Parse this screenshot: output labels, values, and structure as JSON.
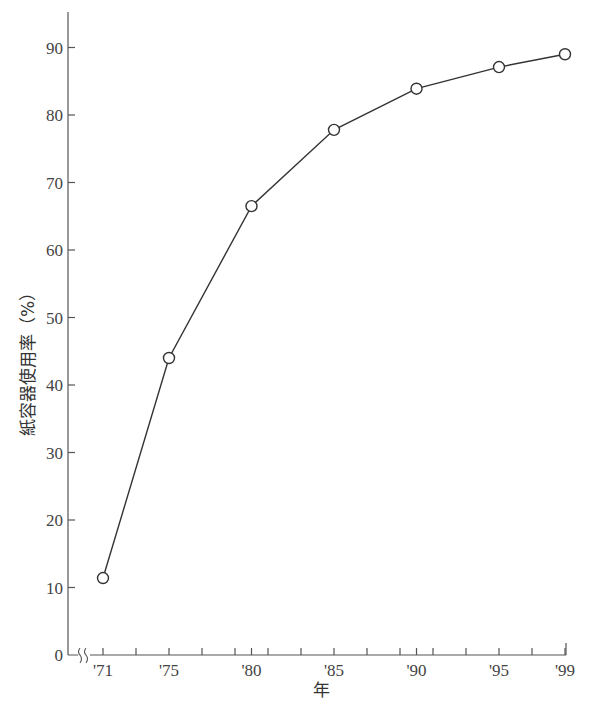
{
  "chart_data": {
    "type": "line",
    "title": "",
    "xlabel": "年",
    "ylabel": "紙容器使用率（%）",
    "x": [
      1971,
      1975,
      1980,
      1985,
      1990,
      1995,
      1999
    ],
    "categories": [
      "'71",
      "'75",
      "'80",
      "'85",
      "'90",
      "'95",
      "'99"
    ],
    "series": [
      {
        "name": "紙容器使用率",
        "values": [
          11.4,
          44.0,
          66.5,
          77.8,
          83.9,
          87.1,
          89.0
        ]
      }
    ],
    "ylim": [
      0,
      95
    ],
    "y_ticks": [
      0,
      10,
      20,
      30,
      40,
      50,
      60,
      70,
      80,
      90
    ],
    "x_tick_labels": [
      "'71",
      "'75",
      "'80",
      "'85",
      "'90",
      "'95",
      "'99"
    ],
    "x_minor_ticks": [
      1971,
      1973,
      1975,
      1977,
      1979,
      1980,
      1981,
      1983,
      1985,
      1987,
      1989,
      1990,
      1991,
      1993,
      1995,
      1997,
      1999
    ],
    "axis_break": true,
    "grid": false,
    "legend": "none",
    "marker": "open-circle",
    "line_color": "#333333"
  }
}
